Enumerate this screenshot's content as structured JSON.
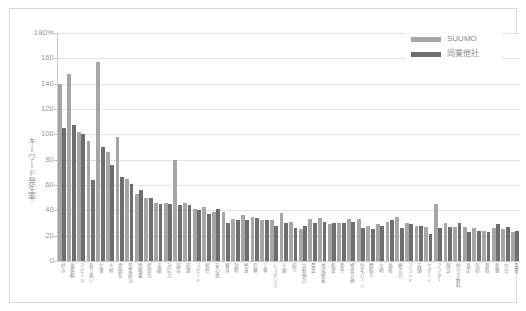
{
  "chart_data": {
    "type": "bar",
    "title": "",
    "subtitle": "",
    "xlabel": "",
    "ylabel": "キーワード発生率",
    "ylim": [
      0,
      180
    ],
    "ytick_labels": [
      "180%",
      "160",
      "140",
      "120",
      "100",
      "80",
      "60",
      "40",
      "20",
      "0"
    ],
    "ytick_values": [
      180,
      160,
      140,
      120,
      100,
      80,
      60,
      40,
      20,
      0
    ],
    "grid": true,
    "legend_position": "top-right",
    "categories": [
      "好み",
      "価値観",
      "アピール",
      "取り扱い",
      "仕事",
      "人柄",
      "雰囲気",
      "営業担当",
      "情報量",
      "提案力",
      "実績",
      "対応力",
      "誠実",
      "知識",
      "スピード",
      "相性",
      "安心感",
      "親身",
      "説明",
      "熱意",
      "信頼",
      "丁寧",
      "レスポンス",
      "人脈",
      "紹介",
      "比較検討",
      "豊富",
      "地域密着",
      "希望",
      "条件",
      "資金計画",
      "住宅ローン",
      "間取り",
      "立地",
      "価格",
      "総合力",
      "ブランド",
      "店舗",
      "サポート",
      "アフター",
      "保証",
      "仲介手数料",
      "査定",
      "売却",
      "買取",
      "新築",
      "中古",
      "賃貸"
    ],
    "series": [
      {
        "name": "SUUMO",
        "color": "#a6a6a6",
        "values": [
          140,
          148,
          102,
          95,
          157,
          86,
          98,
          65,
          53,
          50,
          46,
          46,
          80,
          46,
          41,
          43,
          39,
          39,
          33,
          36,
          35,
          32,
          32,
          38,
          31,
          25,
          33,
          34,
          29,
          30,
          33,
          33,
          28,
          29,
          31,
          35,
          30,
          28,
          27,
          45,
          30,
          27,
          27,
          26,
          24,
          26,
          25,
          23
        ]
      },
      {
        "name": "同業他社",
        "color": "#6e6e6e",
        "values": [
          105,
          107,
          100,
          64,
          90,
          76,
          66,
          61,
          56,
          50,
          45,
          45,
          44,
          44,
          40,
          37,
          41,
          30,
          32,
          32,
          34,
          32,
          28,
          30,
          26,
          28,
          30,
          31,
          30,
          30,
          31,
          26,
          25,
          28,
          32,
          26,
          29,
          28,
          21,
          26,
          27,
          30,
          23,
          24,
          23,
          29,
          27,
          24
        ]
      }
    ]
  },
  "legend": {
    "items": [
      {
        "label": "SUUMO",
        "color": "#a6a6a6"
      },
      {
        "label": "同業他社",
        "color": "#6e6e6e"
      }
    ]
  },
  "axes": {
    "y_title": "キーワード発生率",
    "y_max_label": "180%",
    "y_min_label": "0"
  }
}
